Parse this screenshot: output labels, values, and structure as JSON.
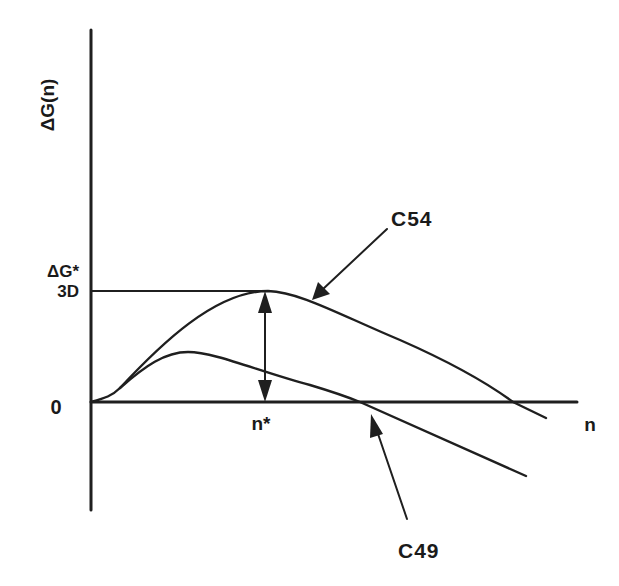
{
  "diagram": {
    "y_axis_label": "ΔG(n)",
    "x_axis_label": "n",
    "barrier_label_top": "ΔG*",
    "barrier_label_bottom": "3D",
    "zero_label": "0",
    "critical_size_label": "n*",
    "curves": [
      {
        "id": "C54",
        "label": "C54",
        "description": "higher barrier curve with maximum at n*, crossing zero at large n"
      },
      {
        "id": "C49",
        "label": "C49",
        "description": "lower barrier curve with smaller maximum, crossing zero earlier"
      }
    ],
    "color": "#1f1f1f"
  }
}
